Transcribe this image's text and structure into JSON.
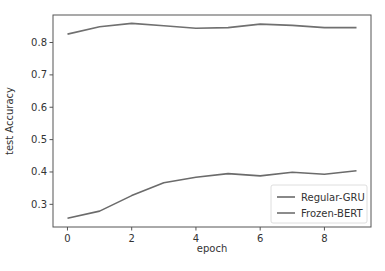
{
  "chart_data": {
    "type": "line",
    "title": "",
    "xlabel": "epoch",
    "ylabel": "test Accuracy",
    "x": [
      0,
      1,
      2,
      3,
      4,
      5,
      6,
      7,
      8,
      9
    ],
    "xticks": [
      0,
      2,
      4,
      6,
      8
    ],
    "xtick_labels": [
      "0",
      "2",
      "4",
      "6",
      "8"
    ],
    "yticks": [
      0.3,
      0.4,
      0.5,
      0.6,
      0.7,
      0.8
    ],
    "ytick_labels": [
      "0.3",
      "0.4",
      "0.5",
      "0.6",
      "0.7",
      "0.8"
    ],
    "xlim": [
      -0.45,
      9.45
    ],
    "ylim": [
      0.23,
      0.885
    ],
    "grid": false,
    "legend_position": "lower right",
    "series": [
      {
        "name": "Regular-GRU",
        "color": "#6b6b6b",
        "values": [
          0.257,
          0.279,
          0.327,
          0.367,
          0.384,
          0.395,
          0.388,
          0.399,
          0.393,
          0.404
        ]
      },
      {
        "name": "Frozen-BERT",
        "color": "#707070",
        "values": [
          0.826,
          0.849,
          0.859,
          0.852,
          0.844,
          0.846,
          0.857,
          0.853,
          0.846,
          0.846
        ]
      }
    ]
  },
  "layout": {
    "plot_left": 53,
    "plot_right": 371,
    "plot_top": 15,
    "plot_bottom": 227,
    "axis_color": "#555555"
  }
}
